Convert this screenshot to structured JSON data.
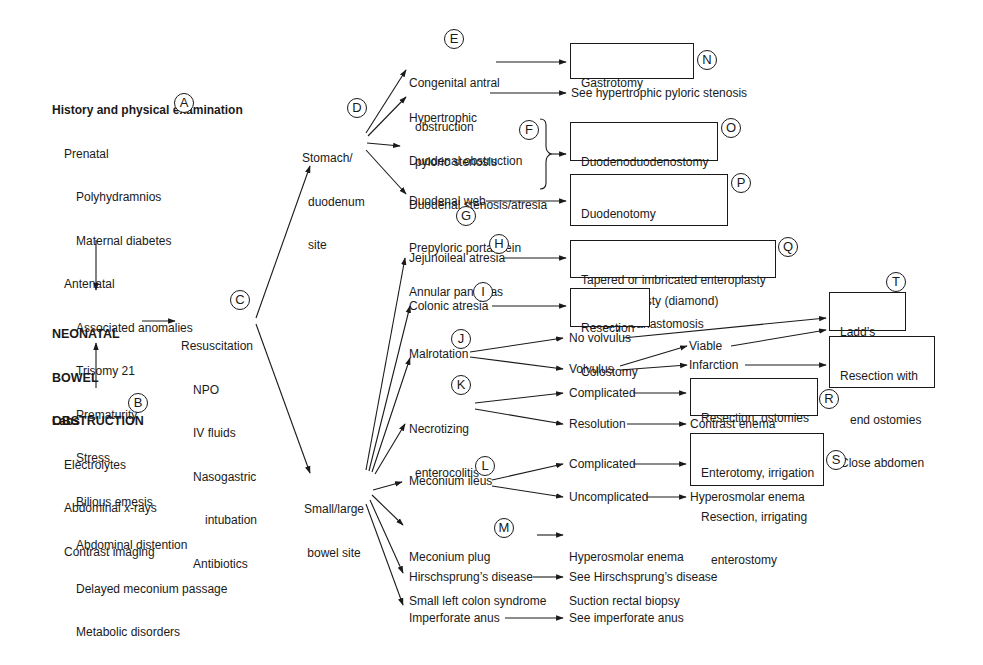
{
  "history": {
    "heading": "History and physical examination",
    "badge": "A",
    "prenatal_label": "Prenatal",
    "prenatal_items": [
      "Polyhydramnios",
      "Maternal diabetes"
    ],
    "antenatal_label": "Antenatal",
    "antenatal_items": [
      "Associated anomalies",
      "Trisomy 21",
      "Prematurity",
      "Stress",
      "Bilious emesis",
      "Abdominal distention",
      "Delayed meconium passage",
      "Metabolic disorders"
    ]
  },
  "center": {
    "lines": [
      "NEONATAL",
      "BOWEL",
      "OBSTRUCTION"
    ]
  },
  "labs": {
    "heading": "Labs",
    "badge": "B",
    "items": [
      "Electrolytes",
      "Abdominal x-rays",
      "Contrast imaging"
    ]
  },
  "resuscitation": {
    "heading": "Resuscitation",
    "badge": "C",
    "items": [
      "NPO",
      "IV fluids",
      "Nasogastric",
      "intubation",
      "Antibiotics"
    ]
  },
  "stomach_site": {
    "lines": [
      "Stomach/",
      "duodenum",
      "site"
    ],
    "badge": "D"
  },
  "bowel_site": {
    "lines": [
      "Small/large",
      "bowel site"
    ]
  },
  "stomach_branches": {
    "congenital": {
      "lines": [
        "Congenital antral",
        "obstruction"
      ],
      "badge": "E"
    },
    "hypertrophic": {
      "lines": [
        "Hypertrophic",
        "pyloric stenosis"
      ],
      "result": "See hypertrophic pyloric stenosis"
    },
    "duodenal_group": {
      "lines": [
        "Duodenal obstruction",
        "Duodenal stenosis/atresia",
        "Prepyloric portal vein",
        "Annular pancreas"
      ],
      "badge": "F"
    },
    "duodenal_web": {
      "label": "Duodenal web",
      "badge": "G"
    }
  },
  "stomach_results": {
    "N": {
      "lines": [
        "Gastrotomy",
        "Membrane excision"
      ],
      "badge": "N"
    },
    "O": {
      "lines": [
        "Duodenoduodenostomy",
        "Duodenojejunostomy"
      ],
      "badge": "O"
    },
    "P": {
      "lines": [
        "Duodenotomy",
        "Web excision",
        "Duodenoplasty (diamond)"
      ],
      "badge": "P"
    }
  },
  "bowel_branches": {
    "jejunoileal": {
      "label": "Jejunoileal atresia",
      "badge": "H"
    },
    "colonic": {
      "label": "Colonic atresia",
      "badge": "I"
    },
    "malrotation": {
      "label": "Malrotation",
      "badge": "J",
      "no_volvulus": "No volvulus",
      "volvulus": "Volvulus",
      "viable": "Viable",
      "infarction": "Infarction"
    },
    "nec": {
      "lines": [
        "Necrotizing",
        "enterocolitis"
      ],
      "badge": "K",
      "complicated": "Complicated",
      "resolution": "Resolution",
      "resolution_result": "Contrast enema"
    },
    "meconium_ileus": {
      "label": "Meconium ileus",
      "badge": "L",
      "complicated": "Complicated",
      "uncomplicated": "Uncomplicated",
      "uncomplicated_result": "Hyperosmolar enema"
    },
    "meconium_plug": {
      "lines": [
        "Meconium plug",
        "Small left colon syndrome"
      ],
      "badge": "M",
      "result_lines": [
        "Hyperosmolar enema",
        "Suction rectal biopsy"
      ]
    },
    "hirschsprung": {
      "label": "Hirschsprung’s disease",
      "result": "See Hirschsprung’s disease"
    },
    "imperforate": {
      "label": "Imperforate anus",
      "result": "See imperforate anus"
    }
  },
  "bowel_results": {
    "Q": {
      "lines": [
        "Tapered or imbricated enteroplasty",
        "Primary reanastomosis"
      ],
      "badge": "Q"
    },
    "colonic_box": {
      "lines": [
        "Resection",
        "Colostomy"
      ]
    },
    "T": {
      "lines": [
        "Ladd’s",
        "procedure"
      ],
      "badge": "T"
    },
    "infarction_box": {
      "lines": [
        "Resection with",
        "   end ostomies",
        "Close abdomen"
      ]
    },
    "R": {
      "lines": [
        "Resection, ostomies",
        "Peritoneal drainage"
      ],
      "badge": "R"
    },
    "S": {
      "lines": [
        "Enterotomy, irrigation",
        "Resection, irrigating",
        "   enterostomy"
      ],
      "badge": "S"
    }
  }
}
